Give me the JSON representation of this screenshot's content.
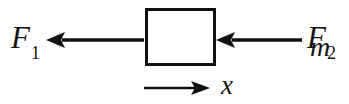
{
  "figure": {
    "type": "free-body-diagram",
    "background_color": "#ffffff",
    "stroke_color": "#111111",
    "width": 349,
    "height": 104
  },
  "labels": {
    "force_left": {
      "symbol": "F",
      "subscript": "1"
    },
    "force_right": {
      "symbol": "F",
      "subscript": "2"
    },
    "mass": "m",
    "axis": "x"
  },
  "arrows": {
    "force_left": {
      "direction": "left",
      "label": "F1"
    },
    "force_right": {
      "direction": "left",
      "label": "F2"
    },
    "axis": {
      "direction": "right",
      "label": "x"
    }
  }
}
